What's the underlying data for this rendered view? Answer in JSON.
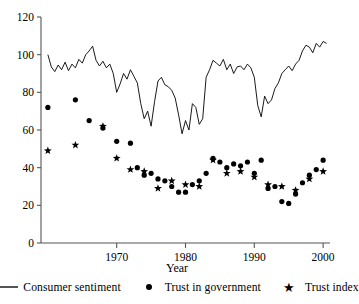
{
  "chart_data": {
    "type": "line",
    "title": "",
    "xlabel": "Year",
    "ylabel": "",
    "xlim": [
      1959,
      2001
    ],
    "ylim": [
      0,
      120
    ],
    "xticks": [
      1970,
      1980,
      1990,
      2000
    ],
    "yticks": [
      0,
      20,
      40,
      60,
      80,
      100,
      120
    ],
    "grid": false,
    "legend_position": "bottom",
    "series": [
      {
        "name": "Consumer sentiment",
        "marker": "line",
        "color": "#000000",
        "x": [
          1960.0,
          1960.5,
          1961.0,
          1961.5,
          1962.0,
          1962.5,
          1963.0,
          1963.5,
          1964.0,
          1964.5,
          1965.0,
          1965.5,
          1966.0,
          1966.5,
          1967.0,
          1967.5,
          1968.0,
          1968.5,
          1969.0,
          1969.5,
          1970.0,
          1970.5,
          1971.0,
          1971.5,
          1972.0,
          1972.5,
          1973.0,
          1973.5,
          1974.0,
          1974.5,
          1975.0,
          1975.5,
          1976.0,
          1976.5,
          1977.0,
          1977.5,
          1978.0,
          1978.5,
          1979.0,
          1979.5,
          1980.0,
          1980.5,
          1981.0,
          1981.5,
          1982.0,
          1982.5,
          1983.0,
          1983.5,
          1984.0,
          1984.5,
          1985.0,
          1985.5,
          1986.0,
          1986.5,
          1987.0,
          1987.5,
          1988.0,
          1988.5,
          1989.0,
          1989.5,
          1990.0,
          1990.5,
          1991.0,
          1991.5,
          1992.0,
          1992.5,
          1993.0,
          1993.5,
          1994.0,
          1994.5,
          1995.0,
          1995.5,
          1996.0,
          1996.5,
          1997.0,
          1997.5,
          1998.0,
          1998.5,
          1999.0,
          1999.5,
          2000.0,
          2000.5
        ],
        "y": [
          100.0,
          93.5,
          91.0,
          94.5,
          92.0,
          96.0,
          91.5,
          95.0,
          93.0,
          97.5,
          95.5,
          100.0,
          102.0,
          104.5,
          97.0,
          94.0,
          96.5,
          93.0,
          95.0,
          90.0,
          80.0,
          84.5,
          90.0,
          87.0,
          92.0,
          88.5,
          85.0,
          74.0,
          66.0,
          70.0,
          62.0,
          75.0,
          86.0,
          88.0,
          84.0,
          83.0,
          81.0,
          77.0,
          68.0,
          58.0,
          65.0,
          60.0,
          74.0,
          72.0,
          63.0,
          66.0,
          88.0,
          92.0,
          97.0,
          95.5,
          94.0,
          97.5,
          92.0,
          95.0,
          90.0,
          93.5,
          94.0,
          92.0,
          95.0,
          93.0,
          88.0,
          73.0,
          67.0,
          78.0,
          74.0,
          76.0,
          82.0,
          85.0,
          90.0,
          92.0,
          94.0,
          91.5,
          95.0,
          97.0,
          102.0,
          105.0,
          104.0,
          101.0,
          106.0,
          104.0,
          107.0,
          106.0
        ]
      },
      {
        "name": "Trust in government",
        "marker": "dot",
        "color": "#000000",
        "x": [
          1960,
          1964,
          1966,
          1968,
          1970,
          1972,
          1973,
          1974,
          1975,
          1976,
          1977,
          1978,
          1979,
          1980,
          1981,
          1982,
          1983,
          1984,
          1985,
          1986,
          1987,
          1988,
          1989,
          1990,
          1991,
          1992,
          1993,
          1994,
          1995,
          1996,
          1997,
          1998,
          1999,
          2000
        ],
        "y": [
          72,
          76,
          65,
          61,
          54,
          53,
          40,
          36,
          37,
          34,
          33,
          30,
          27,
          27,
          31,
          33,
          37,
          45,
          43,
          40,
          42,
          41,
          43,
          37,
          44,
          29,
          30,
          22,
          21,
          26,
          32,
          36,
          39,
          44
        ]
      },
      {
        "name": "Trust index",
        "marker": "star",
        "color": "#000000",
        "x": [
          1960,
          1964,
          1968,
          1970,
          1972,
          1974,
          1976,
          1978,
          1980,
          1982,
          1984,
          1986,
          1988,
          1990,
          1992,
          1994,
          1996,
          1998,
          2000
        ],
        "y": [
          49,
          52,
          62,
          45,
          39,
          38,
          29,
          33,
          31,
          30,
          44,
          37,
          38,
          35,
          31,
          30,
          28,
          34,
          38
        ]
      }
    ]
  },
  "axes": {
    "x_axis_label": "Year",
    "x_tick_labels": [
      "1970",
      "1980",
      "1990",
      "2000"
    ],
    "y_tick_labels": [
      "0",
      "20",
      "40",
      "60",
      "80",
      "100",
      "120"
    ]
  },
  "legend": {
    "items": [
      {
        "label": "Consumer sentiment",
        "marker": "line-key"
      },
      {
        "label": "Trust in government",
        "marker": "dot-key"
      },
      {
        "label": "Trust index",
        "marker": "star-key",
        "glyph": "★"
      }
    ]
  },
  "colors": {
    "line": "#000000",
    "axis": "#555555",
    "marker": "#000000",
    "background": "#ffffff"
  }
}
